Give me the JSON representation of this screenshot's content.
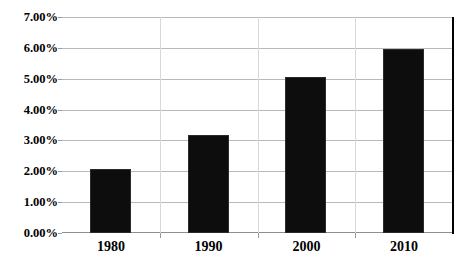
{
  "chart_data": {
    "type": "bar",
    "title": "",
    "subtitle": "",
    "xlabel": "",
    "ylabel": "",
    "categories": [
      "1980",
      "1990",
      "2000",
      "2010"
    ],
    "values": [
      2.07,
      3.18,
      5.06,
      5.97
    ],
    "value_format": "percent",
    "series": [
      {
        "name": "",
        "values": [
          2.07,
          3.18,
          5.06,
          5.97
        ],
        "color": "#0d0d0d"
      }
    ],
    "ylim": [
      0,
      7
    ],
    "ytick_values": [
      0,
      1,
      2,
      3,
      4,
      5,
      6,
      7
    ],
    "ytick_labels": [
      "0.00%",
      "1.00%",
      "2.00%",
      "3.00%",
      "4.00%",
      "5.00%",
      "6.00%",
      "7.00%"
    ],
    "grid": {
      "horizontal": true,
      "vertical": true,
      "color": "#b9b9b9"
    },
    "legend": {
      "visible": false,
      "position": "none",
      "entries": []
    },
    "annotations": [],
    "colors": {
      "bar": "#0d0d0d",
      "gridline": "#b9b9b9",
      "axis": "#8f8f8f",
      "plot_border": "#000000",
      "background": "#ffffff",
      "text": "#000000"
    }
  }
}
